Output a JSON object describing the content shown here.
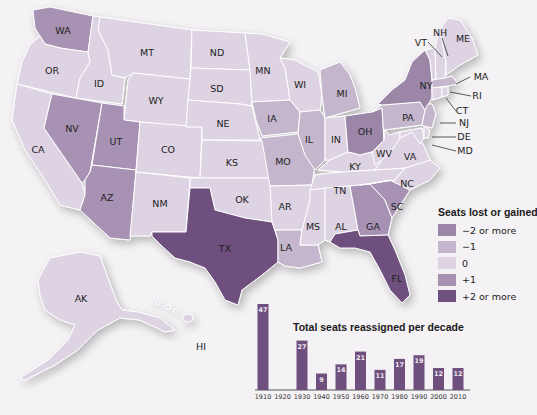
{
  "colors": {
    "minus2": "#9c86a8",
    "minus1": "#c4b6cc",
    "zero": "#ddd3e2",
    "plus1": "#a892b3",
    "plus2": "#6e4f7d",
    "bar": "#6e4f7d"
  },
  "states": [
    {
      "id": "WA",
      "label": "WA",
      "change": "+1"
    },
    {
      "id": "OR",
      "label": "OR",
      "change": "0"
    },
    {
      "id": "CA",
      "label": "CA",
      "change": "0"
    },
    {
      "id": "ID",
      "label": "ID",
      "change": "0"
    },
    {
      "id": "NV",
      "label": "NV",
      "change": "+1"
    },
    {
      "id": "MT",
      "label": "MT",
      "change": "0"
    },
    {
      "id": "WY",
      "label": "WY",
      "change": "0"
    },
    {
      "id": "UT",
      "label": "UT",
      "change": "+1"
    },
    {
      "id": "AZ",
      "label": "AZ",
      "change": "+1"
    },
    {
      "id": "CO",
      "label": "CO",
      "change": "0"
    },
    {
      "id": "NM",
      "label": "NM",
      "change": "0"
    },
    {
      "id": "ND",
      "label": "ND",
      "change": "0"
    },
    {
      "id": "SD",
      "label": "SD",
      "change": "0"
    },
    {
      "id": "NE",
      "label": "NE",
      "change": "0"
    },
    {
      "id": "KS",
      "label": "KS",
      "change": "0"
    },
    {
      "id": "OK",
      "label": "OK",
      "change": "0"
    },
    {
      "id": "TX",
      "label": "TX",
      "change": "+2 or more"
    },
    {
      "id": "MN",
      "label": "MN",
      "change": "0"
    },
    {
      "id": "IA",
      "label": "IA",
      "change": "-1"
    },
    {
      "id": "MO",
      "label": "MO",
      "change": "-1"
    },
    {
      "id": "AR",
      "label": "AR",
      "change": "0"
    },
    {
      "id": "LA",
      "label": "LA",
      "change": "-1"
    },
    {
      "id": "WI",
      "label": "WI",
      "change": "0"
    },
    {
      "id": "IL",
      "label": "IL",
      "change": "-1"
    },
    {
      "id": "MI",
      "label": "MI",
      "change": "-1"
    },
    {
      "id": "IN",
      "label": "IN",
      "change": "0"
    },
    {
      "id": "OH",
      "label": "OH",
      "change": "-2 or more"
    },
    {
      "id": "KY",
      "label": "KY",
      "change": "0"
    },
    {
      "id": "TN",
      "label": "TN",
      "change": "0"
    },
    {
      "id": "MS",
      "label": "MS",
      "change": "0"
    },
    {
      "id": "AL",
      "label": "AL",
      "change": "0"
    },
    {
      "id": "GA",
      "label": "GA",
      "change": "+1"
    },
    {
      "id": "FL",
      "label": "FL",
      "change": "+2 or more"
    },
    {
      "id": "SC",
      "label": "SC",
      "change": "+1"
    },
    {
      "id": "NC",
      "label": "NC",
      "change": "0"
    },
    {
      "id": "VA",
      "label": "VA",
      "change": "0"
    },
    {
      "id": "WV",
      "label": "WV",
      "change": "0"
    },
    {
      "id": "PA",
      "label": "PA",
      "change": "-1"
    },
    {
      "id": "NY",
      "label": "NY",
      "change": "-2 or more"
    },
    {
      "id": "VT",
      "label": "VT",
      "change": "0"
    },
    {
      "id": "NH",
      "label": "NH",
      "change": "0"
    },
    {
      "id": "ME",
      "label": "ME",
      "change": "0"
    },
    {
      "id": "MA",
      "label": "MA",
      "change": "-1"
    },
    {
      "id": "RI",
      "label": "RI",
      "change": "0"
    },
    {
      "id": "CT",
      "label": "CT",
      "change": "0"
    },
    {
      "id": "NJ",
      "label": "NJ",
      "change": "-1"
    },
    {
      "id": "DE",
      "label": "DE",
      "change": "0"
    },
    {
      "id": "MD",
      "label": "MD",
      "change": "0"
    },
    {
      "id": "AK",
      "label": "AK",
      "change": "0"
    },
    {
      "id": "HI",
      "label": "HI",
      "change": "0"
    }
  ],
  "legend": {
    "title": "Seats lost or gained",
    "items": [
      {
        "label": "−2 or more",
        "color": "#9c86a8"
      },
      {
        "label": "−1",
        "color": "#c4b6cc"
      },
      {
        "label": "0",
        "color": "#ddd3e2"
      },
      {
        "label": "+1",
        "color": "#a892b3"
      },
      {
        "label": "+2 or more",
        "color": "#6e4f7d"
      }
    ]
  },
  "chart_data": {
    "type": "bar",
    "title": "Total seats reassigned per decade",
    "categories": [
      "1910",
      "1920",
      "1930",
      "1940",
      "1950",
      "1960",
      "1970",
      "1980",
      "1990",
      "2000",
      "2010"
    ],
    "values": [
      47,
      0,
      27,
      9,
      14,
      21,
      11,
      17,
      19,
      12,
      12
    ],
    "value_labels": [
      "47",
      "",
      "27",
      "9",
      "14",
      "21",
      "11",
      "17",
      "19",
      "12",
      "12"
    ],
    "xlabel": "",
    "ylabel": "",
    "ylim": [
      0,
      47
    ],
    "grid": false,
    "legend": "none"
  }
}
